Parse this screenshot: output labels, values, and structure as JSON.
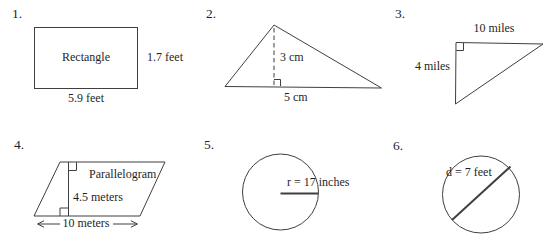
{
  "colors": {
    "background": "#ffffff",
    "line": "#3f3f3f",
    "text": "#1f1f1f"
  },
  "items": [
    {
      "number": "1.",
      "shape": "rectangle",
      "name_label": "Rectangle",
      "height_label": "1.7 feet",
      "base_label": "5.9 feet"
    },
    {
      "number": "2.",
      "shape": "triangle",
      "height_label": "3 cm",
      "base_label": "5 cm"
    },
    {
      "number": "3.",
      "shape": "right-triangle",
      "base_label": "10 miles",
      "height_label": "4 miles"
    },
    {
      "number": "4.",
      "shape": "parallelogram",
      "name_label": "Parallelogram",
      "height_label": "4.5 meters",
      "base_label": "10 meters"
    },
    {
      "number": "5.",
      "shape": "circle",
      "radius_label": "r = 17 inches"
    },
    {
      "number": "6.",
      "shape": "circle",
      "diameter_label": "d = 7 feet"
    }
  ]
}
